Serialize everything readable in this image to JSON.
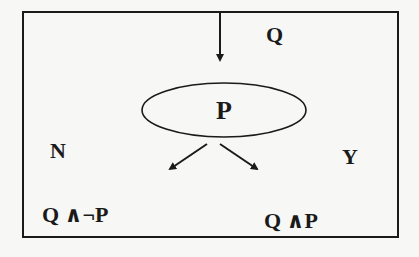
{
  "diagram": {
    "type": "decision-flow",
    "input_label": "Q",
    "decision_node": "P",
    "branch_no_label": "N",
    "branch_yes_label": "Y",
    "outcome_no": "Q ∧¬P",
    "outcome_yes": "Q ∧P",
    "colors": {
      "stroke": "#1a1a1a",
      "background": "#f7f7f5"
    }
  }
}
